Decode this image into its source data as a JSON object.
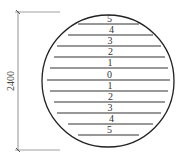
{
  "diagram": {
    "dimension": {
      "label": "2400",
      "x": 18,
      "y_top": 12,
      "y_bottom": 150,
      "ext_x1": 15,
      "ext_x2": 60
    },
    "circle": {
      "cx": 108,
      "cy": 81,
      "r": 66
    },
    "lines": [
      {
        "label": "5",
        "y": 24,
        "x1": 78,
        "x2": 139
      },
      {
        "label": "4",
        "y": 35,
        "x1": 68,
        "x2": 153
      },
      {
        "label": "3",
        "y": 46,
        "x1": 57,
        "x2": 161
      },
      {
        "label": "2",
        "y": 57,
        "x1": 54,
        "x2": 165
      },
      {
        "label": "1",
        "y": 68,
        "x1": 50,
        "x2": 168
      },
      {
        "label": "0",
        "y": 80,
        "x1": 47,
        "x2": 170
      },
      {
        "label": "1",
        "y": 91,
        "x1": 50,
        "x2": 168
      },
      {
        "label": "2",
        "y": 102,
        "x1": 54,
        "x2": 165
      },
      {
        "label": "3",
        "y": 113,
        "x1": 57,
        "x2": 161
      },
      {
        "label": "4",
        "y": 124,
        "x1": 68,
        "x2": 153
      },
      {
        "label": "5",
        "y": 135,
        "x1": 78,
        "x2": 139
      }
    ],
    "colors": {
      "stroke": "#222222",
      "lines": "#333333",
      "dimension": "#777777"
    }
  }
}
